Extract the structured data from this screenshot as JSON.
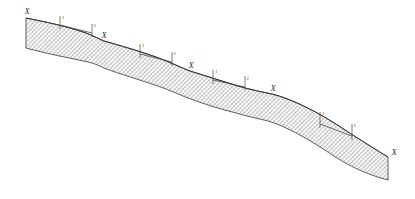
{
  "figure": {
    "name": "hillslope-cross-section",
    "caption": "",
    "background_color": "#ffffff",
    "outline_color": "#3a3a3a",
    "hatch_color": "#6e6e6e",
    "annotation_color": "#4a4a4a",
    "label_color": "#2b2b2b"
  },
  "terrain": {
    "description": "Hatched cross-section of a stepped hillslope descending left to right",
    "top_surface_path": "M 26 18 C 46 22 66 26 86 33 C 94 36 99 39 104 41 C 118 45 136 50 156 57 C 172 63 182 68 190 71 C 206 76 222 81 238 86 C 252 90 262 92 272 94 C 292 99 318 112 342 128 C 362 141 378 151 388 157",
    "bottom_surface_path": "M 26 48 C 48 54 70 58 88 62 C 96 64 100 66 104 68 C 120 74 140 80 158 86 C 172 91 180 95 188 98 C 204 104 220 109 236 113 C 250 117 260 119 268 121 C 286 126 310 140 334 156 C 352 168 372 176 388 180",
    "left_cut_edge": {
      "x": 26,
      "y_top": 18,
      "y_bottom": 48
    },
    "right_cut_edge": {
      "x": 388,
      "y_top": 157,
      "y_bottom": 180
    }
  },
  "station_markers": [
    {
      "label": "X",
      "x": 27,
      "y": 14,
      "station_index": 1
    },
    {
      "label": "X",
      "x": 104,
      "y": 38,
      "station_index": 2
    },
    {
      "label": "X",
      "x": 191,
      "y": 68,
      "station_index": 3
    },
    {
      "label": "X",
      "x": 273,
      "y": 91,
      "station_index": 4
    },
    {
      "label": "X",
      "x": 389,
      "y": 152,
      "station_index": 5
    }
  ],
  "dimension_brackets": [
    {
      "id": "bracket-1",
      "left_tick": {
        "x": 60,
        "y_top": 16,
        "y_bottom": 29
      },
      "right_tick": {
        "x": 92,
        "y_top": 24,
        "y_bottom": 37
      },
      "span_line": {
        "x1": 60,
        "y1": 25,
        "x2": 92,
        "y2": 33
      },
      "tick_label_left": "1",
      "tick_label_right": "2"
    },
    {
      "id": "bracket-2",
      "left_tick": {
        "x": 140,
        "y_top": 44,
        "y_bottom": 58
      },
      "right_tick": {
        "x": 172,
        "y_top": 52,
        "y_bottom": 66
      },
      "span_line": {
        "x1": 140,
        "y1": 54,
        "x2": 172,
        "y2": 62
      },
      "tick_label_left": "1",
      "tick_label_right": "2"
    },
    {
      "id": "bracket-3",
      "left_tick": {
        "x": 213,
        "y_top": 70,
        "y_bottom": 84
      },
      "right_tick": {
        "x": 245,
        "y_top": 76,
        "y_bottom": 90
      },
      "span_line": {
        "x1": 213,
        "y1": 80,
        "x2": 245,
        "y2": 87
      },
      "tick_label_left": "1",
      "tick_label_right": "2"
    },
    {
      "id": "bracket-4",
      "left_tick": {
        "x": 320,
        "y_top": 112,
        "y_bottom": 128
      },
      "right_tick": {
        "x": 352,
        "y_top": 124,
        "y_bottom": 140
      },
      "span_line": {
        "x1": 320,
        "y1": 124,
        "x2": 352,
        "y2": 136
      },
      "tick_label_left": "1",
      "tick_label_right": "2"
    }
  ]
}
